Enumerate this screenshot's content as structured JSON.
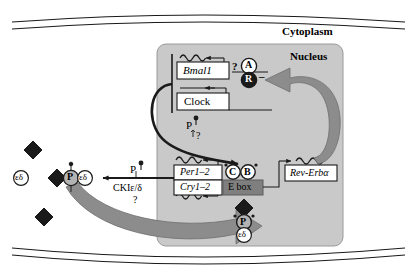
{
  "diagram": {
    "compartments": {
      "cytoplasm_label": "Cytoplasm",
      "nucleus_label": "Nucleus"
    },
    "genes": {
      "bmal1": "Bmal1",
      "clock": "Clock",
      "per": "Per1–2",
      "cry": "Cry1–2",
      "rev_erb": "Rev-Erbα"
    },
    "elements": {
      "e_box": "E box",
      "activator": "A",
      "repressor": "R",
      "repressor_sign": "–",
      "clock_protein": "C",
      "bmal_protein": "B",
      "cry_protein": "C",
      "per_protein": "P",
      "kinase_subunit": "εδ"
    },
    "annotations": {
      "question_a": "?",
      "question_p_nucleus": "?",
      "question_kinase": "?",
      "phosphate_nucleus": "P",
      "phosphate_cytoplasm": "P",
      "kinase_name": "CKIε/δ"
    },
    "colors": {
      "nucleus_fill": "#c9c9c9",
      "cytoplasm_fill": "#ffffff",
      "e_box_fill": "#7f7f7f",
      "gray_arrow": "#8c8c8c",
      "protein_gray": "#b3b3b3",
      "stroke": "#1a1a1a",
      "white": "#ffffff"
    },
    "free_proteins": [
      {
        "name": "cry-free-upper",
        "label": "C"
      },
      {
        "name": "kinase-free",
        "label": "εδ"
      },
      {
        "name": "cry-free-lower",
        "label": "C"
      }
    ],
    "complexes": {
      "cytoplasmic": [
        "C",
        "P",
        "εδ"
      ],
      "nuclear_entry": [
        "C",
        "P",
        "εδ"
      ],
      "e_box_bound": [
        "C",
        "B"
      ]
    }
  }
}
